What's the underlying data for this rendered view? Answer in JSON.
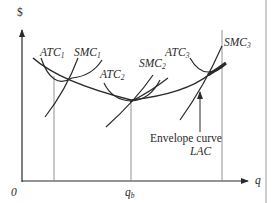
{
  "diagram": {
    "axes": {
      "y_label": "$",
      "x_label": "q",
      "origin_label": "0",
      "x_tick": {
        "label": "q",
        "subscript": "b"
      }
    },
    "curves": [
      {
        "name": "ATC",
        "subscript": "1",
        "type": "short-run average total cost"
      },
      {
        "name": "SMC",
        "subscript": "1",
        "type": "short-run marginal cost"
      },
      {
        "name": "ATC",
        "subscript": "2",
        "type": "short-run average total cost"
      },
      {
        "name": "SMC",
        "subscript": "2",
        "type": "short-run marginal cost"
      },
      {
        "name": "ATC",
        "subscript": "3",
        "type": "short-run average total cost"
      },
      {
        "name": "SMC",
        "subscript": "3",
        "type": "short-run marginal cost"
      }
    ],
    "envelope": {
      "line1": "Envelope curve",
      "line2": "LAC"
    },
    "colors": {
      "line": "#2a2a2a",
      "guide": "#7a7a7a",
      "background": "#ffffff"
    }
  }
}
